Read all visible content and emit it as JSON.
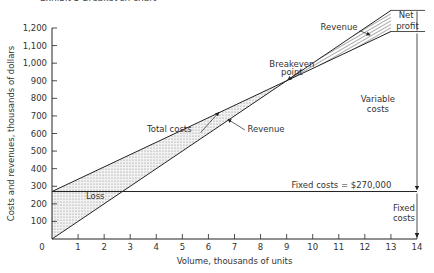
{
  "title": "Exhibit 5  Breakeven chart",
  "chart_data": {
    "type": "line",
    "title": "Exhibit 5 Breakeven chart",
    "xlabel": "Volume, thousands of units",
    "ylabel": "Costs and revenues, thousands of dollars",
    "xlim": [
      0,
      14
    ],
    "ylim": [
      0,
      1200
    ],
    "x_ticks": [
      "0",
      "1",
      "2",
      "3",
      "4",
      "5",
      "6",
      "7",
      "8",
      "9",
      "10",
      "11",
      "12",
      "13",
      "14"
    ],
    "y_ticks": [
      "0",
      "100",
      "200",
      "300",
      "400",
      "500",
      "600",
      "700",
      "800",
      "900",
      "1,000",
      "1,100",
      "1,200"
    ],
    "grid": false,
    "x": [
      0,
      9,
      13
    ],
    "series": [
      {
        "name": "Revenue",
        "values": [
          0,
          900,
          1300
        ]
      },
      {
        "name": "Total costs",
        "values": [
          270,
          900,
          1180
        ]
      },
      {
        "name": "Fixed costs",
        "values": [
          270,
          270,
          270
        ]
      }
    ],
    "annotations": {
      "breakeven": {
        "label": "Breakeven point",
        "x": 9,
        "y": 900
      },
      "loss_region": "Loss",
      "profit_region": "Net profit",
      "fixed_costs_label": "Fixed costs = $270,000",
      "variable_costs_label": "Variable costs",
      "fixed_costs_bracket": "Fixed costs",
      "revenue_label_upper": "Revenue",
      "revenue_label_lower": "Revenue",
      "total_costs_label": "Total costs"
    }
  }
}
